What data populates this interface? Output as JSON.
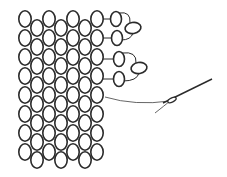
{
  "diagram": {
    "type": "beadwork-stitch-diagram",
    "colors": {
      "background": "#ffffff",
      "stroke": "#2a2a2a",
      "thread": "#555555"
    },
    "bead": {
      "rx": 6.2,
      "ry": 8.2
    },
    "grid": {
      "main_columns_x": [
        25,
        49,
        73,
        97
      ],
      "main_rows_y": [
        19,
        38,
        57,
        76,
        95,
        114,
        133,
        152
      ],
      "offset_columns_x": [
        37,
        61,
        85
      ],
      "offset_rows_y": [
        28,
        47,
        66,
        85,
        104,
        123,
        142,
        160
      ]
    },
    "picots": [
      {
        "beads": [
          {
            "cx": 116,
            "cy": 19,
            "rx": 5.5,
            "ry": 7.5,
            "rot": 0
          },
          {
            "cx": 133,
            "cy": 28,
            "rx": 8,
            "ry": 5.5,
            "rot": -10
          },
          {
            "cx": 117,
            "cy": 38,
            "rx": 5.5,
            "ry": 7.5,
            "rot": 0
          }
        ]
      },
      {
        "beads": [
          {
            "cx": 119,
            "cy": 59,
            "rx": 5.5,
            "ry": 7.5,
            "rot": 0
          },
          {
            "cx": 139,
            "cy": 68,
            "rx": 8,
            "ry": 5.5,
            "rot": -10
          },
          {
            "cx": 119,
            "cy": 79,
            "rx": 5.5,
            "ry": 7.5,
            "rot": 0
          }
        ]
      }
    ],
    "needle": {
      "x1": 163,
      "y1": 103,
      "x2": 212,
      "y2": 79,
      "eye_cx": 172,
      "eye_cy": 100
    },
    "thread_tail": {
      "from": [
        105,
        97
      ],
      "to": [
        155,
        108
      ]
    }
  }
}
